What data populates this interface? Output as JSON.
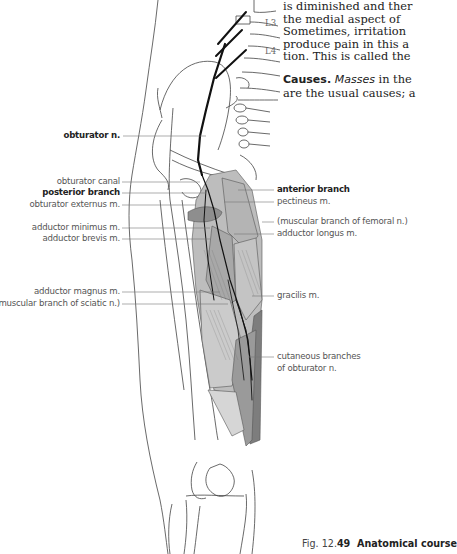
{
  "body_text": {
    "lines": [
      "is diminished and ther",
      "the medial aspect of",
      "Sometimes, irritation",
      "produce pain in this a",
      "tion. This is called the"
    ],
    "causes_heading": "Causes.",
    "causes_italic": "Masses",
    "causes_line1_rest": " in the",
    "causes_line2": "are the usual causes; a"
  },
  "vertebra_labels": {
    "l3": "L3",
    "l4": "L4"
  },
  "labels_left": {
    "obturator_n": "obturator n.",
    "obturator_canal": "obturator canal",
    "posterior_branch": "posterior branch",
    "obturator_externus": "obturator externus m.",
    "adductor_minimus": "adductor minimus m.",
    "adductor_brevis": "adductor brevis m.",
    "adductor_magnus": "adductor magnus m.",
    "muscular_branch_sciatic": "(muscular branch of sciatic n.)"
  },
  "labels_right": {
    "anterior_branch": "anterior branch",
    "pectineus": "pectineus m.",
    "muscular_branch_femoral": "(muscular branch of femoral n.)",
    "adductor_longus": "adductor longus m.",
    "gracilis": "gracilis m.",
    "cutaneous_line1": "cutaneous branches",
    "cutaneous_line2": "of obturator n."
  },
  "caption": {
    "prefix": "Fig. 12.",
    "number": "49",
    "title": "  Anatomical course"
  },
  "colors": {
    "muscle_light": "#c8c8c8",
    "muscle_mid": "#a9a9a9",
    "muscle_dark": "#8a8a8a",
    "nerve": "#111111",
    "outline": "#444444",
    "leader": "#777777"
  }
}
